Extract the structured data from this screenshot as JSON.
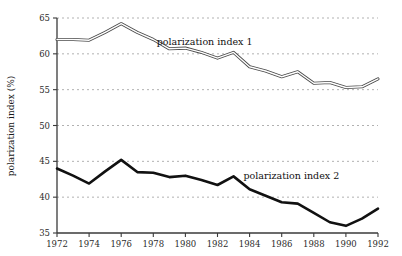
{
  "chart_data": {
    "type": "line",
    "title": "",
    "xlabel": "",
    "ylabel": "polarization index (%)",
    "xlim": [
      1972,
      1992
    ],
    "ylim": [
      35,
      65
    ],
    "grid": "horizontal-dashed",
    "legend": "inline-annotations",
    "x": [
      1972,
      1973,
      1974,
      1975,
      1976,
      1977,
      1978,
      1979,
      1980,
      1981,
      1982,
      1983,
      1984,
      1985,
      1986,
      1987,
      1988,
      1989,
      1990,
      1991,
      1992
    ],
    "xticks": [
      "1972",
      "1974",
      "1976",
      "1978",
      "1980",
      "1982",
      "1984",
      "1986",
      "1988",
      "1990",
      "1992"
    ],
    "xtick_values": [
      1972,
      1974,
      1976,
      1978,
      1980,
      1982,
      1984,
      1986,
      1988,
      1990,
      1992
    ],
    "yticks": [
      "65",
      "60",
      "55",
      "50",
      "45",
      "40",
      "35"
    ],
    "ytick_values": [
      65,
      60,
      55,
      50,
      45,
      40,
      35
    ],
    "series": [
      {
        "name": "polarization index 1",
        "style": "double-outline-line",
        "color": "#555555",
        "label_x": 1981.2,
        "label_y": 61.2,
        "values": [
          62.0,
          62.0,
          61.9,
          63.0,
          64.2,
          63.0,
          62.0,
          60.7,
          60.8,
          60.2,
          59.4,
          60.2,
          58.2,
          57.6,
          56.8,
          57.5,
          55.9,
          56.0,
          55.3,
          55.4,
          56.5
        ]
      },
      {
        "name": "polarization index 2",
        "style": "thick-solid-line",
        "color": "#111111",
        "label_x": 1986.6,
        "label_y": 42.6,
        "values": [
          44.0,
          43.0,
          41.9,
          43.6,
          45.2,
          43.5,
          43.4,
          42.8,
          43.0,
          42.4,
          41.7,
          42.9,
          41.1,
          40.2,
          39.3,
          39.1,
          37.8,
          36.5,
          36.0,
          37.0,
          38.4
        ]
      }
    ]
  },
  "axes": {
    "y_axis_title": "polarization index (%)"
  },
  "series_labels": {
    "index1": "polarization index 1",
    "index2": "polarization index 2"
  }
}
